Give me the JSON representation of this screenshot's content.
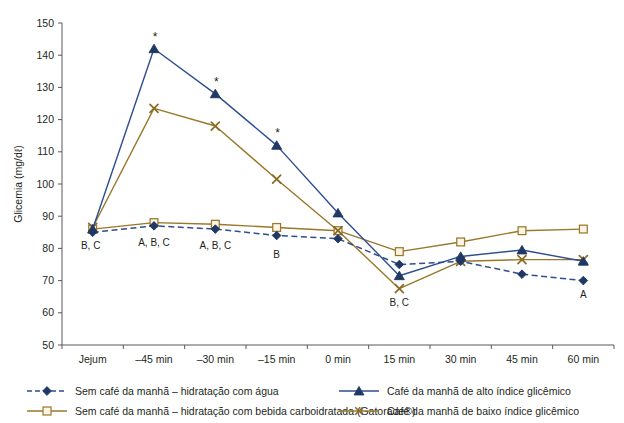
{
  "chart_data": {
    "type": "line",
    "title": "",
    "xlabel": "",
    "ylabel": "Glicemia (mg/dℓ)",
    "categories": [
      "Jejum",
      "–45 min",
      "–30 min",
      "–15 min",
      "0 min",
      "15 min",
      "30 min",
      "45 min",
      "60 min"
    ],
    "ylim": [
      50,
      150
    ],
    "yticks": [
      50,
      60,
      70,
      80,
      90,
      100,
      110,
      120,
      130,
      140,
      150
    ],
    "grid": false,
    "legend_position": "bottom",
    "series": [
      {
        "name": "Sem café da manhã – hidratação com água",
        "key": "agua",
        "color": "#2e4e8f",
        "marker": "diamond",
        "dash": "dashed",
        "values": [
          85,
          87,
          86,
          84,
          83,
          75,
          76,
          72,
          70
        ]
      },
      {
        "name": "Sem café da manhã – hidratação com bebida carboidratada (Gatorade®)",
        "key": "gatorade",
        "color": "#9a7729",
        "marker": "square-open",
        "dash": "solid",
        "values": [
          86,
          88,
          87.5,
          86.5,
          85.5,
          79,
          82,
          85.5,
          86
        ]
      },
      {
        "name": "Café da manhã de alto índice glicêmico",
        "key": "alto",
        "color": "#2e4e8f",
        "marker": "triangle",
        "dash": "solid",
        "values": [
          86,
          142,
          128,
          112,
          91,
          71.5,
          77.5,
          79.5,
          76
        ]
      },
      {
        "name": "Café da manhã de baixo índice glicêmico",
        "key": "baixo",
        "color": "#9a7729",
        "marker": "cross",
        "dash": "solid",
        "values": [
          86.5,
          123.5,
          118,
          101.5,
          85.5,
          67.5,
          76,
          76.5,
          76.5
        ]
      }
    ],
    "annotations": [
      {
        "text": "B, C",
        "category": "Jejum",
        "value": 85,
        "dx": -2,
        "dy": 17
      },
      {
        "text": "A, B, C",
        "category": "–45 min",
        "value": 87,
        "dx": 0,
        "dy": 20
      },
      {
        "text": "A, B, C",
        "category": "–30 min",
        "value": 86,
        "dx": 0,
        "dy": 20
      },
      {
        "text": "B",
        "category": "–15 min",
        "value": 84,
        "dx": 0,
        "dy": 22
      },
      {
        "text": "B, C",
        "category": "15 min",
        "value": 67.5,
        "dx": 0,
        "dy": 17
      },
      {
        "text": "A",
        "category": "60 min",
        "value": 70,
        "dx": 0,
        "dy": 17
      }
    ],
    "significance_markers": [
      {
        "symbol": "*",
        "category": "–45 min",
        "value": 142,
        "series": "alto"
      },
      {
        "symbol": "*",
        "category": "–30 min",
        "value": 128,
        "series": "alto"
      },
      {
        "symbol": "*",
        "category": "–15 min",
        "value": 112,
        "series": "alto"
      }
    ]
  },
  "legend": {
    "items": [
      {
        "label": "Sem café da manhã – hidratação com água",
        "column": "left"
      },
      {
        "label": "Sem café da manhã – hidratação com bebida carboidratada (Gatorade®)",
        "column": "left"
      },
      {
        "label": "Café da manhã de alto índice glicêmico",
        "column": "right"
      },
      {
        "label": "Café da manhã de baixo índice glicêmico",
        "column": "right"
      }
    ]
  },
  "colors": {
    "blue": "#2e4e8f",
    "brown": "#9a7729",
    "axis": "#58595b",
    "text": "#231f20",
    "background": "#ffffff"
  }
}
